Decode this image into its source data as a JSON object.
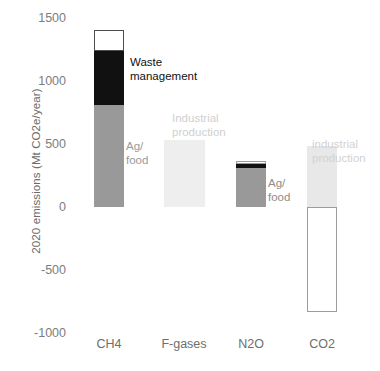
{
  "chart_data": {
    "type": "bar",
    "title": "",
    "subtitle": "",
    "xlabel": "",
    "ylabel": "2020 emissions (Mt CO2e/year)",
    "categories": [
      "CH4",
      "F-gases",
      "N2O",
      "CO2"
    ],
    "ylim": [
      -1000,
      1500
    ],
    "yticks": [
      1500,
      1000,
      500,
      0,
      -500,
      -1000
    ],
    "ytick_labels": [
      "1500",
      "1000",
      "500",
      "0",
      "-500",
      "-1000"
    ],
    "grid": false,
    "legend": "none",
    "stacked": true,
    "series": [
      {
        "name": "Ag/food",
        "color": "#999999",
        "values": [
          810,
          0,
          310,
          0
        ]
      },
      {
        "name": "Waste management",
        "color": "#111111",
        "values": [
          430,
          0,
          30,
          0
        ]
      },
      {
        "name": "Other",
        "color": "#ffffff",
        "values": [
          165,
          0,
          25,
          0
        ]
      },
      {
        "name": "Industrial production",
        "color": "#e8e8e8",
        "values": [
          0,
          530,
          0,
          485
        ]
      },
      {
        "name": "CO2 removal / sink",
        "color": "#ffffff",
        "values": [
          0,
          0,
          0,
          -830
        ]
      }
    ],
    "bars": [
      {
        "category": "CH4",
        "x_center": 109,
        "width": 30,
        "segments": [
          {
            "label": "Ag/food",
            "value_from": 0,
            "value_to": 810,
            "fill": "#999999",
            "stroke": "none"
          },
          {
            "label": "Waste management",
            "value_from": 810,
            "value_to": 1240,
            "fill": "#111111",
            "stroke": "none"
          },
          {
            "label": "Other",
            "value_from": 1240,
            "value_to": 1405,
            "fill": "#ffffff",
            "stroke": "#4d4d4d"
          }
        ]
      },
      {
        "category": "F-gases",
        "x_center": 184,
        "width": 41,
        "segments": [
          {
            "label": "Industrial production",
            "value_from": 0,
            "value_to": 530,
            "fill": "#eeeeee",
            "stroke": "none"
          }
        ]
      },
      {
        "category": "N2O",
        "x_center": 251,
        "width": 30,
        "segments": [
          {
            "label": "Ag/food",
            "value_from": 0,
            "value_to": 310,
            "fill": "#999999",
            "stroke": "none"
          },
          {
            "label": "Waste management",
            "value_from": 310,
            "value_to": 340,
            "fill": "#111111",
            "stroke": "none"
          },
          {
            "label": "Other",
            "value_from": 340,
            "value_to": 365,
            "fill": "#ffffff",
            "stroke": "#9a9a9a"
          }
        ]
      },
      {
        "category": "CO2",
        "x_center": 322,
        "width": 30,
        "segments": [
          {
            "label": "Industrial production",
            "value_from": 0,
            "value_to": 485,
            "fill": "#e8e8e8",
            "stroke": "none"
          },
          {
            "label": "Sink",
            "value_from": -830,
            "value_to": 0,
            "fill": "#ffffff",
            "stroke": "#9c9c9c"
          }
        ]
      }
    ],
    "annotations": [
      {
        "id": "waste",
        "text": "Waste\nmanagement",
        "color": "#111111",
        "x": 130,
        "y": 55
      },
      {
        "id": "agfood_ch4",
        "text": "Ag/\nfood",
        "color": "#9a9a9a",
        "x": 126,
        "y": 139
      },
      {
        "id": "ind_fgases",
        "text": "Industrial\nproduction",
        "color": "#cfcfcf",
        "x": 172,
        "y": 111
      },
      {
        "id": "agfood_n2o",
        "text": "Ag/\nfood",
        "color": "#8d8d8d",
        "x": 268,
        "y": 176
      },
      {
        "id": "ind_co2",
        "text": "industrial\nproduction",
        "color": "#d2d2d2",
        "x": 312,
        "y": 137
      }
    ]
  },
  "axis": {
    "ylabel": "2020 emissions (Mt CO2e/year)",
    "ytick_labels": [
      "1500",
      "1000",
      "500",
      "0",
      "-500",
      "-1000"
    ],
    "xtick_labels": [
      "CH4",
      "F-gases",
      "N2O",
      "CO2"
    ]
  },
  "annotations": {
    "waste_management": "Waste\nmanagement",
    "ag_food_ch4": "Ag/\nfood",
    "industrial_production_fgases": "Industrial\nproduction",
    "ag_food_n2o": "Ag/\nfood",
    "industrial_production_co2": "industrial\nproduction"
  }
}
